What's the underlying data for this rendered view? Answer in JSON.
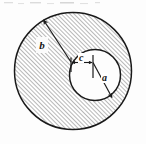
{
  "figure": {
    "name": "eccentric-annulus-cross-section",
    "background_color": "#fdfdfd",
    "line_color": "#1a1a1a",
    "hatch_color": "#8d8d8d",
    "fill_color": "#ffffff",
    "labels": {
      "outer_radius": "b",
      "inner_radius": "a",
      "offset": "c"
    },
    "geometry": {
      "outer_circle": {
        "cx": 73,
        "cy": 71,
        "r": 58.5
      },
      "inner_circle": {
        "cx": 95,
        "cy": 75,
        "r": 25.5
      },
      "outer_radius_leader": {
        "x1": 71,
        "y1": 62,
        "x2": 42.5,
        "y2": 18.5
      },
      "inner_radius_leader": {
        "x1": 93,
        "y1": 62.5,
        "x2": 113,
        "y2": 99
      },
      "offset_dimension": {
        "x1": 71,
        "y1": 62,
        "x2": 93,
        "y2": 62
      },
      "offset_tick_left": {
        "x": 71,
        "y1": 57,
        "y2": 72
      },
      "offset_tick_right": {
        "x": 93,
        "y1": 55,
        "y2": 78
      }
    }
  }
}
